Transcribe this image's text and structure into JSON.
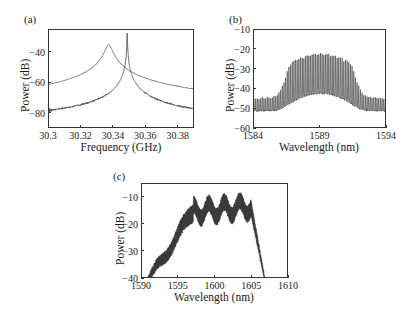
{
  "figure": {
    "width": 412,
    "height": 319,
    "background": "#ffffff",
    "line_color": "#555555",
    "axis_color": "#333333",
    "text_color": "#1a1a1a"
  },
  "panels": {
    "a": {
      "label": "(a)",
      "xlabel": "Frequency (GHz)",
      "ylabel": "Power (dB)",
      "xticks": [
        "30.3",
        "30.32",
        "30.34",
        "30.36",
        "30.38"
      ],
      "yticks": [
        "−40",
        "−60",
        "−80"
      ]
    },
    "b": {
      "label": "(b)",
      "xlabel": "Wavelength (nm)",
      "ylabel": "Power (dB)",
      "xticks": [
        "1584",
        "1589",
        "1594"
      ],
      "yticks": [
        "−10",
        "−20",
        "−30",
        "−40",
        "−50",
        "−60"
      ]
    },
    "c": {
      "label": "(c)",
      "xlabel": "Wavelength (nm)",
      "ylabel": "Power (dB)",
      "xticks": [
        "1590",
        "1595",
        "1600",
        "1605",
        "1610"
      ],
      "yticks": [
        "−10",
        "−20",
        "−30",
        "−40"
      ]
    }
  },
  "chart_data": [
    {
      "id": "panel-a",
      "type": "line",
      "title": "(a)",
      "xlabel": "Frequency (GHz)",
      "ylabel": "Power (dB)",
      "xlim": [
        30.3,
        30.39
      ],
      "ylim": [
        -90,
        -25
      ],
      "xticks": [
        30.3,
        30.32,
        30.34,
        30.36,
        30.38
      ],
      "yticks": [
        -40,
        -60,
        -80
      ],
      "grid": false,
      "legend": "none",
      "annotation": "Two overlaid RF beat-note spectra: a broad Lorentzian free-running peak centred near 30.337 GHz and a narrow locked spike near 30.348 GHz sitting on a flat noise floor near −83 dB.",
      "series": [
        {
          "name": "free-running (broad Lorentzian peak)",
          "noise_floor": -83,
          "peak_x": 30.3368,
          "peak_y": -34.5,
          "lorentzian_hwhm": 0.0018
        },
        {
          "name": "locked (narrow spike)",
          "noise_floor": -83.5,
          "peak_x": 30.3482,
          "peak_y": -27.0,
          "lorentzian_hwhm": 0.00012
        }
      ]
    },
    {
      "id": "panel-b",
      "type": "line",
      "title": "(b)",
      "xlabel": "Wavelength (nm)",
      "ylabel": "Power (dB)",
      "xlim": [
        1584,
        1594
      ],
      "ylim": [
        -60,
        -10
      ],
      "xticks": [
        1584,
        1589,
        1594
      ],
      "yticks": [
        -10,
        -20,
        -30,
        -40,
        -50,
        -60
      ],
      "grid": false,
      "legend": "none",
      "annotation": "Optical comb spectrum with ~0.25 nm mode spacing; envelope peaks near −15 dB at 1589 nm, falling to a pedestal near −48 dB at the edges.",
      "comb": {
        "spacing_nm": 0.25,
        "envelope_center_nm": 1589.0,
        "envelope_peak_db": -15,
        "envelope_sigma_nm": 0.75,
        "pedestal_db": -48,
        "baseline_db": -51
      }
    },
    {
      "id": "panel-c",
      "type": "line",
      "title": "(c)",
      "xlabel": "Wavelength (nm)",
      "ylabel": "Power (dB)",
      "xlim": [
        1590,
        1610
      ],
      "ylim": [
        -40,
        -5
      ],
      "xticks": [
        1590,
        1595,
        1600,
        1605,
        1610
      ],
      "yticks": [
        -10,
        -20,
        -30,
        -40
      ],
      "grid": false,
      "legend": "none",
      "annotation": "Broad dense-filled super-continuum-like spectrum: rises from −40 dB at 1591 nm, flat-topped ripple region between −10 and −20 dB from 1597 to 1605 nm, sharp roll-off to −40 dB by 1607 nm.",
      "envelope": {
        "rise_start_nm": 1590.8,
        "plateau_start_nm": 1597.0,
        "plateau_end_nm": 1604.8,
        "fall_end_nm": 1606.8,
        "plateau_top_db": -11,
        "plateau_bottom_db": -19,
        "ripple_period_nm": 2.1,
        "band_thickness_db": 5.5
      }
    }
  ]
}
